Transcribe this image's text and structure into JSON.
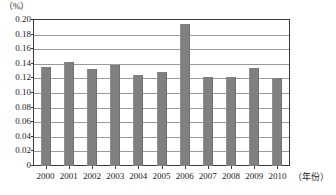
{
  "chart_data": {
    "type": "bar",
    "title": "",
    "subtitle": "",
    "xlabel": "（年份）",
    "ylabel": "（%）",
    "categories": [
      "2000",
      "2001",
      "2002",
      "2003",
      "2004",
      "2005",
      "2006",
      "2007",
      "2008",
      "2009",
      "2010"
    ],
    "values": [
      0.136,
      0.143,
      0.133,
      0.139,
      0.124,
      0.129,
      0.195,
      0.122,
      0.122,
      0.134,
      0.121
    ],
    "ylim": [
      0,
      0.2
    ],
    "ytick_labels": [
      "0.20",
      "0.18",
      "0.16",
      "0.14",
      "0.12",
      "0.10",
      "0.08",
      "0.06",
      "0.04",
      "0.02",
      "0"
    ],
    "ytick_values": [
      0.2,
      0.18,
      0.16,
      0.14,
      0.12,
      0.1,
      0.08,
      0.06,
      0.04,
      0.02,
      0
    ],
    "grid": true,
    "legend": "none",
    "series_color": "#808080",
    "annotations": []
  }
}
